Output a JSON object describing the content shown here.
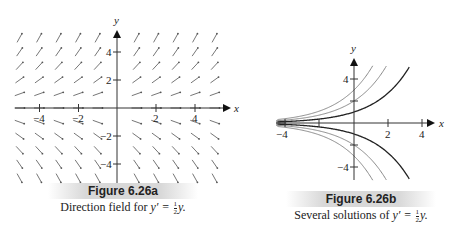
{
  "chart_data": [
    {
      "type": "vector-field",
      "title": "Figure 6.26a",
      "caption": "Direction field for y' = ½y.",
      "equation": "y' = (1/2) y",
      "xlabel": "x",
      "ylabel": "y",
      "xlim": [
        -5.5,
        5.5
      ],
      "ylim": [
        -5.5,
        5.5
      ],
      "x_ticks": [
        -4,
        -2,
        2,
        4
      ],
      "y_ticks": [
        -4,
        -2,
        2,
        4
      ],
      "grid_x": [
        -5,
        -4,
        -3,
        -2,
        -1,
        1,
        2,
        3,
        4,
        5
      ],
      "grid_y": [
        5,
        4,
        3,
        2,
        1,
        0,
        -1,
        -2,
        -3,
        -4,
        -5
      ],
      "slope_rule": "slope = y/2"
    },
    {
      "type": "line",
      "title": "Figure 6.26b",
      "caption": "Several solutions of y' = ½y.",
      "equation": "y' = (1/2) y",
      "xlabel": "x",
      "ylabel": "y",
      "xlim": [
        -4.5,
        4.5
      ],
      "ylim": [
        -5,
        5
      ],
      "x_ticks": [
        -4,
        2,
        4
      ],
      "y_ticks": [
        4,
        -4
      ],
      "series": [
        {
          "name": "y = 3e^{x/2}",
          "C": 3
        },
        {
          "name": "y = 2e^{x/2}",
          "C": 2
        },
        {
          "name": "y = e^{x/2}",
          "C": 1
        },
        {
          "name": "y = -e^{x/2}",
          "C": -1
        },
        {
          "name": "y = -2e^{x/2}",
          "C": -2
        },
        {
          "name": "y = -3e^{x/2}",
          "C": -3
        }
      ]
    }
  ],
  "figure_a": {
    "title": "Figure 6.26a",
    "caption_prefix": "Direction field for ",
    "caption_eq_lhs": "y′ = ",
    "frac_num": "1",
    "frac_den": "2",
    "caption_eq_rhs": "y.",
    "x_label": "x",
    "y_label": "y",
    "tick_labels": {
      "xm4": "−4",
      "xm2": "−2",
      "x2": "2",
      "x4": "4",
      "y4": "4",
      "y2": "2",
      "ym2": "−2",
      "ym4": "−4"
    }
  },
  "figure_b": {
    "title": "Figure 6.26b",
    "caption_prefix": "Several solutions of ",
    "caption_eq_lhs": "y′ = ",
    "frac_num": "1",
    "frac_den": "2",
    "caption_eq_rhs": "y.",
    "x_label": "x",
    "y_label": "y",
    "tick_labels": {
      "xm4": "−4",
      "x2": "2",
      "x4": "4",
      "y4": "4",
      "ym4": "−4"
    }
  }
}
